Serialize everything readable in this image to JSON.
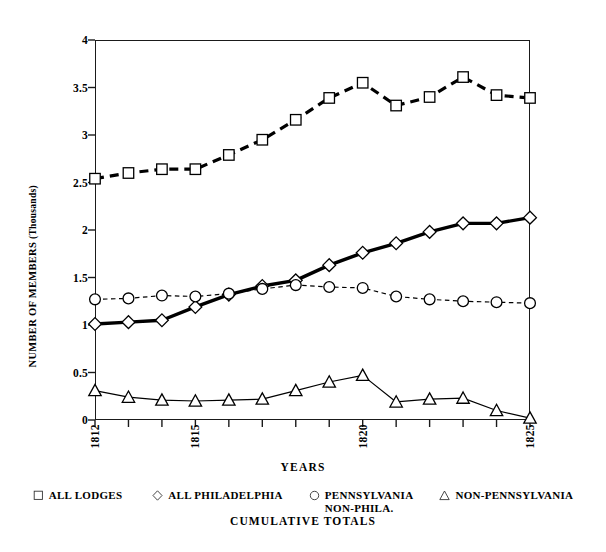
{
  "chart_data": {
    "type": "line",
    "title": "",
    "subtitle": "CUMULATIVE TOTALS",
    "xlabel": "YEARS",
    "ylabel": "NUMBER OF MEMBERS",
    "ylabel_sub": "(Thousands)",
    "grid": false,
    "legend_position": "bottom",
    "xlim": [
      1812,
      1825
    ],
    "ylim": [
      0,
      4
    ],
    "ytick_values": [
      0,
      0.5,
      1,
      1.5,
      2,
      2.5,
      3,
      3.5,
      4
    ],
    "ytick_labels": [
      "0",
      "0.5",
      "1",
      "1.5",
      "2",
      "2.5",
      "3",
      "3.5",
      "4"
    ],
    "x": [
      1812,
      1813,
      1814,
      1815,
      1816,
      1817,
      1818,
      1819,
      1820,
      1821,
      1822,
      1823,
      1824,
      1825
    ],
    "xtick_values": [
      1812,
      1813,
      1814,
      1815,
      1816,
      1817,
      1818,
      1819,
      1820,
      1821,
      1822,
      1823,
      1824,
      1825
    ],
    "xtick_labels": [
      "1812",
      "",
      "",
      "1815",
      "",
      "",
      "",
      "",
      "1820",
      "",
      "",
      "",
      "",
      "1825"
    ],
    "series": [
      {
        "name": "ALL LODGES",
        "marker": "square",
        "linestyle": "dashed",
        "linewidth": 3.2,
        "color": "#000000",
        "values": [
          2.54,
          2.6,
          2.64,
          2.64,
          2.79,
          2.95,
          3.16,
          3.39,
          3.55,
          3.31,
          3.4,
          3.61,
          3.42,
          3.39
        ]
      },
      {
        "name": "ALL PHILADELPHIA",
        "marker": "diamond",
        "linestyle": "solid",
        "linewidth": 3.4,
        "color": "#000000",
        "values": [
          1.01,
          1.03,
          1.05,
          1.19,
          1.32,
          1.41,
          1.47,
          1.63,
          1.76,
          1.86,
          1.98,
          2.07,
          2.07,
          2.13
        ]
      },
      {
        "name": "PENNSYLVANIA\nNON-PHILA.",
        "marker": "circle",
        "linestyle": "dashed",
        "linewidth": 1.2,
        "color": "#000000",
        "values": [
          1.27,
          1.28,
          1.31,
          1.3,
          1.33,
          1.38,
          1.42,
          1.4,
          1.39,
          1.3,
          1.27,
          1.25,
          1.24,
          1.23
        ]
      },
      {
        "name": "NON-PENNSYLVANIA",
        "marker": "triangle",
        "linestyle": "solid",
        "linewidth": 1.2,
        "color": "#000000",
        "values": [
          0.31,
          0.24,
          0.21,
          0.2,
          0.21,
          0.22,
          0.31,
          0.4,
          0.47,
          0.19,
          0.22,
          0.23,
          0.1,
          0.02
        ]
      }
    ]
  },
  "legend": {
    "items": [
      {
        "label": "ALL LODGES",
        "marker": "square-marker-icon"
      },
      {
        "label": "ALL PHILADELPHIA",
        "marker": "diamond-marker-icon"
      },
      {
        "label": "PENNSYLVANIA\nNON-PHILA.",
        "marker": "circle-marker-icon"
      },
      {
        "label": "NON-PENNSYLVANIA",
        "marker": "triangle-marker-icon"
      }
    ],
    "footer": "CUMULATIVE TOTALS"
  },
  "colors": {
    "axis": "#1a1a1a",
    "ink": "#000000",
    "background": "#ffffff"
  }
}
